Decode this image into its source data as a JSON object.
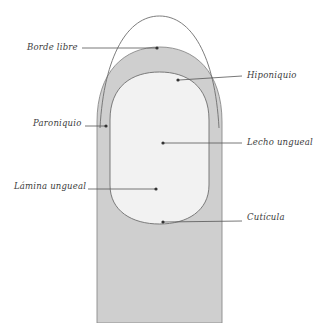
{
  "figure": {
    "background_color": "#ffffff",
    "finger_fill": "#cfcfcf",
    "nail_plate_fill": "#f2f2f2",
    "outline_color": "#6e6e6e",
    "leader_color": "#555555",
    "text_color": "#3c3c3c"
  },
  "labels": {
    "borde_libre": "Borde libre",
    "hiponiquio": "Hiponiquio",
    "paroniquio": "Paroniquio",
    "lecho_ungueal": "Lecho ungueal",
    "lamina_ungueal": "Lámina ungueal",
    "cuticula": "Cutícula"
  },
  "leaders": [
    {
      "name": "borde-libre",
      "x1": 82,
      "y1": 48,
      "x2": 157,
      "y2": 48,
      "side": "left"
    },
    {
      "name": "hiponiquio",
      "x1": 242,
      "y1": 76,
      "x2": 178,
      "y2": 80,
      "side": "right"
    },
    {
      "name": "paroniquio",
      "x1": 98,
      "y1": 126,
      "x2": 108,
      "y2": 126,
      "side": "left"
    },
    {
      "name": "lecho-ungueal",
      "x1": 242,
      "y1": 143,
      "x2": 163,
      "y2": 143,
      "side": "right"
    },
    {
      "name": "lamina-ungueal",
      "x1": 88,
      "y1": 189,
      "x2": 157,
      "y2": 189,
      "side": "left"
    },
    {
      "name": "cuticula",
      "x1": 242,
      "y1": 221,
      "x2": 163,
      "y2": 222,
      "side": "right"
    }
  ]
}
